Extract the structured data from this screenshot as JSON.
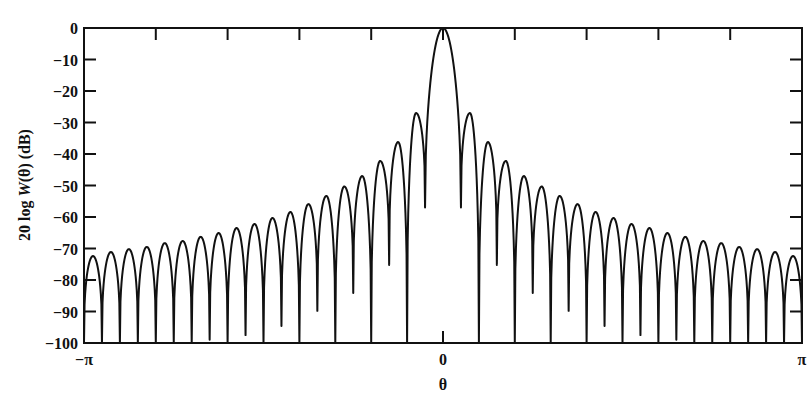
{
  "chart_data": {
    "type": "line",
    "title": "",
    "xlabel": "θ",
    "ylabel_parts": [
      "20 log ",
      "W",
      "(θ) (dB)"
    ],
    "ylabel": "20 log W(θ) (dB)",
    "xlim": [
      "-π",
      "π"
    ],
    "ylim": [
      -100,
      0
    ],
    "grid": false,
    "legend": null,
    "x_tick_labels": [
      {
        "label": "−π",
        "pos": -1
      },
      {
        "label": "0",
        "pos": 0
      },
      {
        "label": "π",
        "pos": 1
      }
    ],
    "x_minor_ticks_per_pi": 5,
    "y_ticks": [
      0,
      -10,
      -20,
      -30,
      -40,
      -50,
      -60,
      -70,
      -80,
      -90,
      -100
    ],
    "y_tick_labels": [
      "0",
      "−10",
      "−20",
      "−30",
      "−40",
      "−50",
      "−60",
      "−70",
      "−80",
      "−90",
      "−100"
    ],
    "series": [
      {
        "name": "20 log W(θ)",
        "symmetric": true,
        "lobe_spacing_pi": 0.05,
        "main_lobe_peak_db": 0,
        "sidelobe_peaks_db": [
          -27.0,
          -36.2,
          -42.2,
          -47.0,
          -50.3,
          -53.3,
          -55.9,
          -58.4,
          -60.3,
          -62.2,
          -63.5,
          -65.1,
          -66.3,
          -67.6,
          -68.3,
          -69.5,
          -70.2,
          -71.1,
          -72.4,
          -72.0
        ],
        "dip_db": [
          -57,
          -100,
          -75.2,
          -100,
          -84.1,
          -100,
          -89.8,
          -100,
          -94.6,
          -100,
          -97.5,
          -100,
          -99,
          -100,
          -100,
          -100,
          -100,
          -100,
          -100,
          -100
        ]
      }
    ]
  }
}
